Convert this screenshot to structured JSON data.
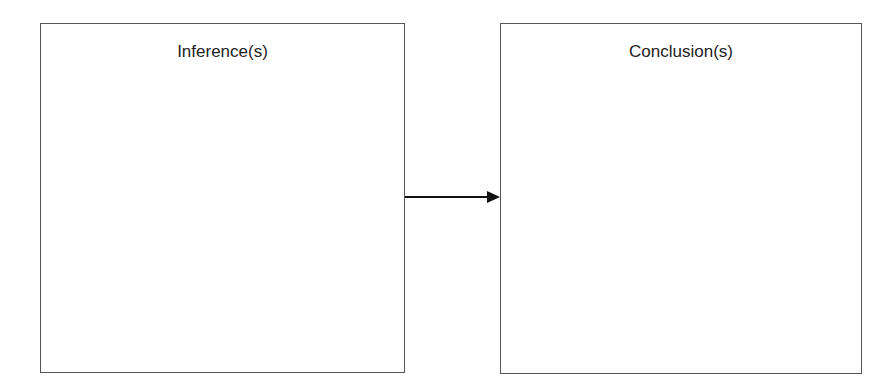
{
  "diagram": {
    "boxes": [
      {
        "id": "inference",
        "label": "Inference(s)"
      },
      {
        "id": "conclusion",
        "label": "Conclusion(s)"
      }
    ],
    "edges": [
      {
        "from": "inference",
        "to": "conclusion",
        "type": "arrow"
      }
    ],
    "colors": {
      "border": "#555555",
      "arrow": "#111111",
      "text": "#222222"
    }
  }
}
